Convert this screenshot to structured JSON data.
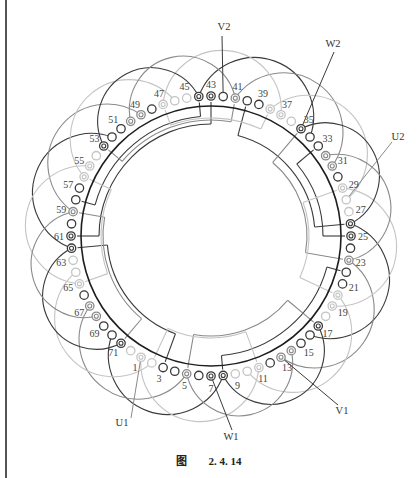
{
  "figure": {
    "caption_prefix": "图",
    "caption_number": "2. 4. 14",
    "center": [
      211,
      236
    ],
    "stator_radius": 130,
    "slot_radius": 140,
    "slot_count": 72,
    "reference_slot": 25,
    "degrees_per_slot": 5
  },
  "terminals": [
    {
      "name": "V2",
      "label": "V2",
      "slot": 42,
      "text_xy": [
        224,
        30
      ],
      "line_end": [
        222,
        36
      ]
    },
    {
      "name": "W2",
      "label": "W2",
      "slot": 35,
      "text_xy": [
        333,
        47
      ],
      "line_end": [
        334,
        52
      ]
    },
    {
      "name": "U2",
      "label": "U2",
      "slot": 28,
      "text_xy": [
        398,
        140
      ],
      "line_end": [
        392,
        142
      ]
    },
    {
      "name": "U1",
      "label": "U1",
      "slot": 1,
      "text_xy": [
        122,
        426
      ],
      "line_end": [
        131,
        418
      ]
    },
    {
      "name": "W1",
      "label": "W1",
      "slot": 7,
      "text_xy": [
        231,
        440
      ],
      "line_end": [
        232,
        430
      ]
    },
    {
      "name": "V1",
      "label": "V1",
      "slot": 13,
      "text_xy": [
        342,
        414
      ],
      "line_end": [
        338,
        405
      ]
    }
  ],
  "slot_labels": [
    1,
    3,
    5,
    7,
    9,
    11,
    13,
    15,
    17,
    19,
    21,
    23,
    25,
    27,
    29,
    31,
    33,
    35,
    37,
    39,
    41,
    43,
    45,
    47,
    49,
    51,
    53,
    55,
    57,
    59,
    61,
    63,
    65,
    67,
    69,
    71
  ],
  "slot_markers": {
    "1": "light-double",
    "2": "light-open",
    "3": "dark-open",
    "4": "dark-open",
    "5": "gray-double",
    "6": "dark-open",
    "7": "dark-double",
    "8": "dark-double",
    "9": "light-open",
    "10": "light-open",
    "11": "light-double",
    "12": "dark-open",
    "13": "gray-double",
    "14": "gray-double",
    "15": "dark-open",
    "16": "dark-open",
    "17": "dark-double",
    "18": "light-open",
    "19": "light-double",
    "20": "light-double",
    "21": "dark-open",
    "22": "dark-open",
    "23": "gray-double",
    "24": "dark-open",
    "25": "dark-double",
    "26": "dark-double",
    "27": "light-open",
    "28": "light-open",
    "29": "light-double",
    "30": "dark-open",
    "31": "gray-double",
    "32": "gray-double",
    "33": "dark-open",
    "34": "dark-open",
    "35": "dark-double",
    "36": "light-open",
    "37": "light-double",
    "38": "light-double",
    "39": "dark-open",
    "40": "dark-open",
    "41": "gray-double",
    "42": "dark-open",
    "43": "dark-double",
    "44": "dark-double",
    "45": "light-open",
    "46": "light-open",
    "47": "light-double",
    "48": "dark-open",
    "49": "gray-double",
    "50": "gray-double",
    "51": "dark-open",
    "52": "dark-open",
    "53": "dark-double",
    "54": "light-open",
    "55": "light-double",
    "56": "light-double",
    "57": "dark-open",
    "58": "dark-open",
    "59": "gray-double",
    "60": "dark-open",
    "61": "dark-double",
    "62": "dark-double",
    "63": "light-open",
    "64": "light-open",
    "65": "light-double",
    "66": "dark-open",
    "67": "gray-double",
    "68": "gray-double",
    "69": "dark-open",
    "70": "dark-open",
    "71": "dark-double",
    "72": "light-open"
  },
  "colors": {
    "dark": "#3a3a3a",
    "gray": "#8a8a8a",
    "light": "#c4c4c4",
    "stator": "#1e1e1e"
  }
}
